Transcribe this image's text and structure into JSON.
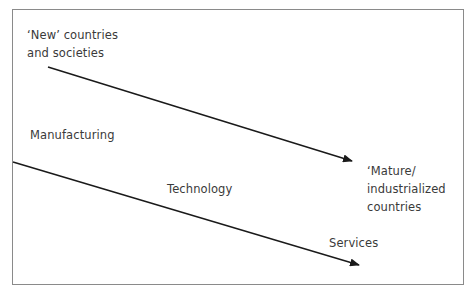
{
  "diagram": {
    "labels": {
      "new_line1": "‘New’ countries",
      "new_line2": "and societies",
      "manufacturing": "Manufacturing",
      "technology": "Technology",
      "mature_line1": "‘Mature/",
      "mature_line2": "industrialized",
      "mature_line3": "countries",
      "services": "Services"
    },
    "arrows": [
      {
        "from": "'New' countries and societies",
        "to": "'Mature/ industrialized countries"
      },
      {
        "from": "Manufacturing",
        "via": "Technology",
        "to": "Services"
      }
    ],
    "colors": {
      "line": "#1a1a1a",
      "text": "#3a3a3a",
      "frame": "#8a8a8a"
    }
  }
}
